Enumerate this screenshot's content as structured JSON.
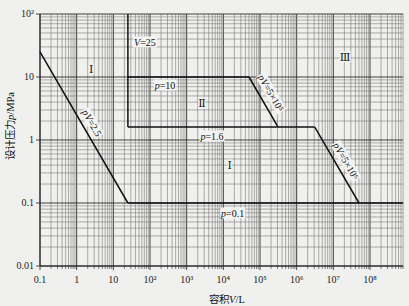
{
  "chart_data": {
    "type": "line",
    "title": "",
    "xlabel": "容积V/L",
    "ylabel": "设计压力p/MPa",
    "xscale": "log",
    "yscale": "log",
    "xlim": [
      0.1,
      800000000
    ],
    "ylim": [
      0.01,
      100
    ],
    "grid": true,
    "legend": null,
    "xticks": [
      {
        "value": 0.1,
        "label": "0.1"
      },
      {
        "value": 1,
        "label": "1"
      },
      {
        "value": 10,
        "label": "10"
      },
      {
        "value": 100,
        "label": "10²"
      },
      {
        "value": 1000,
        "label": "10³"
      },
      {
        "value": 10000,
        "label": "10⁴"
      },
      {
        "value": 100000,
        "label": "10⁵"
      },
      {
        "value": 1000000,
        "label": "10⁶"
      },
      {
        "value": 10000000,
        "label": "10⁷"
      },
      {
        "value": 100000000,
        "label": "10⁸"
      }
    ],
    "yticks": [
      {
        "value": 0.01,
        "label": "0.01"
      },
      {
        "value": 0.1,
        "label": "0.1"
      },
      {
        "value": 1,
        "label": "1"
      },
      {
        "value": 10,
        "label": "10"
      },
      {
        "value": 100,
        "label": "10²"
      }
    ],
    "series": [
      {
        "name": "pV=2.5",
        "points": [
          [
            0.1,
            25
          ],
          [
            25,
            0.1
          ]
        ]
      },
      {
        "name": "p=0.1",
        "points": [
          [
            25,
            0.1
          ],
          [
            800000000,
            0.1
          ]
        ]
      },
      {
        "name": "V=25",
        "points": [
          [
            25,
            100
          ],
          [
            25,
            1.6
          ]
        ]
      },
      {
        "name": "p=10",
        "points": [
          [
            25,
            10
          ],
          [
            50000,
            10
          ]
        ]
      },
      {
        "name": "pV=5×10⁵",
        "points": [
          [
            50000,
            10
          ],
          [
            312500,
            1.6
          ]
        ]
      },
      {
        "name": "p=1.6",
        "points": [
          [
            25,
            1.6
          ],
          [
            3125000,
            1.6
          ]
        ]
      },
      {
        "name": "pV=5×10⁶",
        "points": [
          [
            3125000,
            1.6
          ],
          [
            50000000,
            0.1
          ]
        ]
      }
    ],
    "annotations": [
      {
        "name": "region-1-upper-label",
        "text": "Ⅰ",
        "kind": "region",
        "V": 2.5,
        "p": 13.4,
        "rotate": 0
      },
      {
        "name": "v-25-label",
        "text": "V=25",
        "kind": "line",
        "V": 73,
        "p": 36,
        "rotate": 0
      },
      {
        "name": "p-10-label",
        "text": "p=10",
        "kind": "line",
        "V": 256,
        "p": 7.5,
        "rotate": 0
      },
      {
        "name": "region-2-label",
        "text": "Ⅱ",
        "kind": "region",
        "V": 2620,
        "p": 3.9,
        "rotate": 0
      },
      {
        "name": "region-3-label",
        "text": "Ⅲ",
        "kind": "region",
        "V": 21000000,
        "p": 20.8,
        "rotate": 0
      },
      {
        "name": "p-1-6-label",
        "text": "p=1.6",
        "kind": "line",
        "V": 4900,
        "p": 1.16,
        "rotate": 0
      },
      {
        "name": "region-1-lower-label",
        "text": "Ⅰ",
        "kind": "region",
        "V": 15000,
        "p": 0.4,
        "rotate": 0
      },
      {
        "name": "p-0-1-label",
        "text": "p=0.1",
        "kind": "line",
        "V": 18000,
        "p": 0.069,
        "rotate": 0
      },
      {
        "name": "pv-2-5-label",
        "text": "pV=2.5",
        "kind": "line",
        "V": 2.62,
        "p": 1.86,
        "rotate": 60
      },
      {
        "name": "pv-5e5-label",
        "text": "pV=5×10⁵",
        "kind": "line",
        "V": 200000,
        "p": 5.6,
        "rotate": 60
      },
      {
        "name": "pv-5e6-label",
        "text": "pV=5×10⁶",
        "kind": "line",
        "V": 22000000,
        "p": 0.46,
        "rotate": 60
      }
    ]
  }
}
